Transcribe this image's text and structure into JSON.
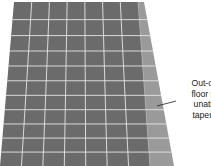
{
  "figure": {
    "type": "floor-tile-perspective-diagram",
    "grid": {
      "top_left": [
        14,
        2
      ],
      "top_right_dark": [
        138,
        2
      ],
      "top_right_strip": [
        144,
        2
      ],
      "bottom_left": [
        0,
        166
      ],
      "bottom_right_dark": [
        150,
        166
      ],
      "bottom_right_strip": [
        174,
        166
      ],
      "columns": 7,
      "rows": 11,
      "tile_color": "#6b6b6b",
      "tile_color_dark": "#5e5e5e",
      "strip_color": "#9a9a9a",
      "grout_color": "#e6e6e6"
    },
    "callout": {
      "lines": [
        "Out-of-s",
        "floor res",
        "unattra",
        "tapered"
      ],
      "leader_from": [
        176,
        101
      ],
      "leader_to": [
        157,
        106
      ]
    }
  }
}
